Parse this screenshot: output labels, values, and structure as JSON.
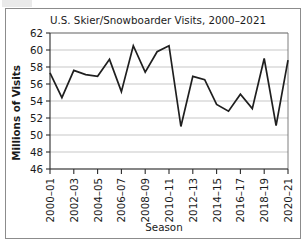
{
  "chart_data": {
    "type": "line",
    "title": "U.S. Skier/Snowboarder Visits, 2000–2021",
    "xlabel": "Season",
    "ylabel": "Millions of Visits",
    "categories": [
      "2000–01",
      "2001–02",
      "2002–03",
      "2003–04",
      "2004–05",
      "2005–06",
      "2006–07",
      "2007–08",
      "2008–09",
      "2009–10",
      "2010–11",
      "2011–12",
      "2012–13",
      "2013–14",
      "2014–15",
      "2015–16",
      "2016–17",
      "2017–18",
      "2018–19",
      "2019–20",
      "2020–21"
    ],
    "values": [
      57.3,
      54.4,
      57.6,
      57.1,
      56.9,
      58.9,
      55.1,
      60.5,
      57.4,
      59.8,
      60.5,
      51.0,
      56.9,
      56.5,
      53.6,
      52.8,
      54.8,
      53.1,
      59.0,
      51.1,
      58.8
    ],
    "ylim": [
      46,
      62
    ],
    "ytick_labels": [
      "62",
      "60",
      "58",
      "56",
      "54",
      "52",
      "50",
      "48",
      "46"
    ],
    "ytick_values": [
      62,
      60,
      58,
      56,
      54,
      52,
      50,
      48,
      46
    ],
    "xtick_labels": [
      "2000–01",
      "2002–03",
      "2004–05",
      "2006–07",
      "2008–09",
      "2010–11",
      "2012–13",
      "2014–15",
      "2016–17",
      "2018–19",
      "2020–21"
    ],
    "xtick_indices": [
      0,
      2,
      4,
      6,
      8,
      10,
      12,
      14,
      16,
      18,
      20
    ],
    "grid": true,
    "legend": false,
    "series_color": "#1f1f1f",
    "grid_color": "#b9b9b9",
    "axis_color": "#2b2b2b"
  }
}
